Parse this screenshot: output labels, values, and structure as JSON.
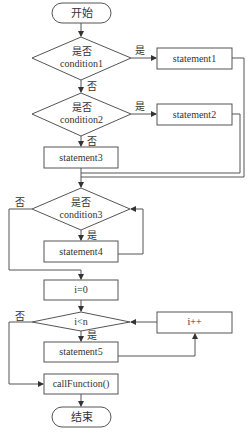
{
  "diagram": {
    "type": "flowchart",
    "colors": {
      "stroke": "#555555",
      "text": "#333333",
      "background": "#ffffff"
    },
    "nodes": {
      "start": {
        "shape": "terminal",
        "label": "开始"
      },
      "cond1": {
        "shape": "decision",
        "line1": "是否",
        "line2": "condition1"
      },
      "stmt1": {
        "shape": "process",
        "label": "statement1"
      },
      "cond2": {
        "shape": "decision",
        "line1": "是否",
        "line2": "condition2"
      },
      "stmt2": {
        "shape": "process",
        "label": "statement2"
      },
      "stmt3": {
        "shape": "process",
        "label": "statement3"
      },
      "cond3": {
        "shape": "decision",
        "line1": "是否",
        "line2": "condition3"
      },
      "stmt4": {
        "shape": "process",
        "label": "statement4"
      },
      "init": {
        "shape": "process",
        "label": "i=0"
      },
      "cond4": {
        "shape": "decision",
        "line1": "i<n"
      },
      "incr": {
        "shape": "process",
        "label": "i++"
      },
      "stmt5": {
        "shape": "process",
        "label": "statement5"
      },
      "call": {
        "shape": "process",
        "label": "callFunction()"
      },
      "end": {
        "shape": "terminal",
        "label": "结束"
      }
    },
    "edge_labels": {
      "cond1_yes": "是",
      "cond1_no": "否",
      "cond2_yes": "是",
      "cond2_no": "否",
      "cond3_yes": "是",
      "cond3_no": "否",
      "cond4_yes": "是",
      "cond4_no": "否"
    },
    "edges": [
      [
        "start",
        "cond1"
      ],
      [
        "cond1",
        "stmt1",
        "是"
      ],
      [
        "cond1",
        "cond2",
        "否"
      ],
      [
        "cond2",
        "stmt2",
        "是"
      ],
      [
        "cond2",
        "stmt3",
        "否"
      ],
      [
        "stmt1",
        "cond3"
      ],
      [
        "stmt2",
        "cond3"
      ],
      [
        "stmt3",
        "cond3"
      ],
      [
        "cond3",
        "stmt4",
        "是"
      ],
      [
        "stmt4",
        "cond3"
      ],
      [
        "cond3",
        "init",
        "否"
      ],
      [
        "init",
        "cond4"
      ],
      [
        "cond4",
        "stmt5",
        "是"
      ],
      [
        "stmt5",
        "incr"
      ],
      [
        "incr",
        "cond4"
      ],
      [
        "cond4",
        "call",
        "否"
      ],
      [
        "call",
        "end"
      ]
    ]
  }
}
